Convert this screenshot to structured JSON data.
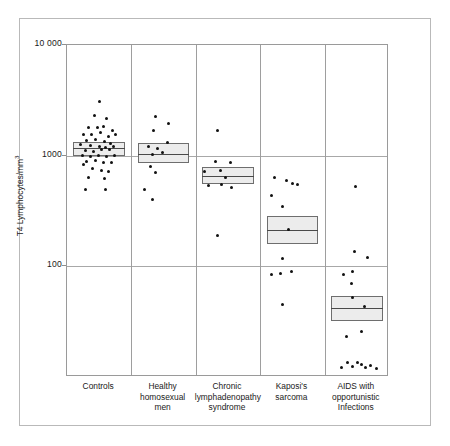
{
  "chart_data": {
    "type": "scatter",
    "title": "",
    "subtitle": "",
    "xlabel": "",
    "ylabel": "T4 Lymphocytes/mm",
    "ylabel_superscript": "3",
    "yscale": "log",
    "ylim": [
      10,
      10000
    ],
    "ytick_labels": [
      "10 000",
      "1000",
      "100"
    ],
    "ytick_values": [
      10000,
      1000,
      100
    ],
    "grid": true,
    "legend": "none",
    "categories": [
      "Controls",
      "Healthy homosexual men",
      "Chronic lymphadenopathy syndrome",
      "Kaposi's sarcoma",
      "AIDS with opportunistic Infections"
    ],
    "category_lines": [
      [
        "Controls"
      ],
      [
        "Healthy",
        "homosexual",
        "men"
      ],
      [
        "Chronic",
        "lymphadenopathy",
        "syndrome"
      ],
      [
        "Kaposi's",
        "sarcoma"
      ],
      [
        "AIDS with",
        "opportunistic",
        "Infections"
      ]
    ],
    "series": [
      {
        "name": "Controls",
        "box": {
          "lower": 1000,
          "median": 1180,
          "upper": 1330
        },
        "points": [
          {
            "xoff": 0.5,
            "value": 3100
          },
          {
            "xoff": 0.42,
            "value": 2300
          },
          {
            "xoff": 0.62,
            "value": 2150
          },
          {
            "xoff": 0.33,
            "value": 1800
          },
          {
            "xoff": 0.47,
            "value": 1800
          },
          {
            "xoff": 0.56,
            "value": 1820
          },
          {
            "xoff": 0.7,
            "value": 1700
          },
          {
            "xoff": 0.26,
            "value": 1560
          },
          {
            "xoff": 0.38,
            "value": 1550
          },
          {
            "xoff": 0.52,
            "value": 1620
          },
          {
            "xoff": 0.64,
            "value": 1500
          },
          {
            "xoff": 0.75,
            "value": 1560
          },
          {
            "xoff": 0.3,
            "value": 1380
          },
          {
            "xoff": 0.44,
            "value": 1400
          },
          {
            "xoff": 0.58,
            "value": 1340
          },
          {
            "xoff": 0.68,
            "value": 1300
          },
          {
            "xoff": 0.21,
            "value": 1250
          },
          {
            "xoff": 0.36,
            "value": 1230
          },
          {
            "xoff": 0.5,
            "value": 1200
          },
          {
            "xoff": 0.6,
            "value": 1190
          },
          {
            "xoff": 0.72,
            "value": 1220
          },
          {
            "xoff": 0.28,
            "value": 1120
          },
          {
            "xoff": 0.41,
            "value": 1100
          },
          {
            "xoff": 0.54,
            "value": 1130
          },
          {
            "xoff": 0.66,
            "value": 1140
          },
          {
            "xoff": 0.24,
            "value": 1000
          },
          {
            "xoff": 0.37,
            "value": 980
          },
          {
            "xoff": 0.49,
            "value": 1010
          },
          {
            "xoff": 0.62,
            "value": 990
          },
          {
            "xoff": 0.73,
            "value": 1010
          },
          {
            "xoff": 0.31,
            "value": 880
          },
          {
            "xoff": 0.45,
            "value": 900
          },
          {
            "xoff": 0.57,
            "value": 870
          },
          {
            "xoff": 0.69,
            "value": 860
          },
          {
            "xoff": 0.26,
            "value": 830
          },
          {
            "xoff": 0.4,
            "value": 760
          },
          {
            "xoff": 0.53,
            "value": 740
          },
          {
            "xoff": 0.65,
            "value": 720
          },
          {
            "xoff": 0.34,
            "value": 640
          },
          {
            "xoff": 0.58,
            "value": 620
          },
          {
            "xoff": 0.28,
            "value": 490
          },
          {
            "xoff": 0.6,
            "value": 490
          }
        ]
      },
      {
        "name": "Healthy homosexual men",
        "box": {
          "lower": 860,
          "median": 1040,
          "upper": 1300
        },
        "points": [
          {
            "xoff": 0.38,
            "value": 2270
          },
          {
            "xoff": 0.58,
            "value": 1950
          },
          {
            "xoff": 0.35,
            "value": 1680
          },
          {
            "xoff": 0.56,
            "value": 1320
          },
          {
            "xoff": 0.26,
            "value": 1210
          },
          {
            "xoff": 0.4,
            "value": 1170
          },
          {
            "xoff": 0.33,
            "value": 1030
          },
          {
            "xoff": 0.49,
            "value": 1060
          },
          {
            "xoff": 0.29,
            "value": 790
          },
          {
            "xoff": 0.37,
            "value": 700
          },
          {
            "xoff": 0.21,
            "value": 490
          },
          {
            "xoff": 0.33,
            "value": 400
          }
        ]
      },
      {
        "name": "Chronic lymphadenopathy syndrome",
        "box": {
          "lower": 560,
          "median": 660,
          "upper": 790
        },
        "points": [
          {
            "xoff": 0.34,
            "value": 1700
          },
          {
            "xoff": 0.3,
            "value": 880
          },
          {
            "xoff": 0.54,
            "value": 870
          },
          {
            "xoff": 0.14,
            "value": 720
          },
          {
            "xoff": 0.38,
            "value": 730
          },
          {
            "xoff": 0.46,
            "value": 640
          },
          {
            "xoff": 0.2,
            "value": 540
          },
          {
            "xoff": 0.4,
            "value": 545
          },
          {
            "xoff": 0.56,
            "value": 520
          },
          {
            "xoff": 0.34,
            "value": 190
          }
        ]
      },
      {
        "name": "Kaposi's sarcoma",
        "box": {
          "lower": 160,
          "median": 215,
          "upper": 285
        },
        "points": [
          {
            "xoff": 0.22,
            "value": 640
          },
          {
            "xoff": 0.41,
            "value": 600
          },
          {
            "xoff": 0.5,
            "value": 560
          },
          {
            "xoff": 0.58,
            "value": 550
          },
          {
            "xoff": 0.18,
            "value": 440
          },
          {
            "xoff": 0.34,
            "value": 350
          },
          {
            "xoff": 0.44,
            "value": 215
          },
          {
            "xoff": 0.34,
            "value": 118
          },
          {
            "xoff": 0.18,
            "value": 84
          },
          {
            "xoff": 0.32,
            "value": 86
          },
          {
            "xoff": 0.48,
            "value": 90
          },
          {
            "xoff": 0.34,
            "value": 45
          }
        ]
      },
      {
        "name": "AIDS with opportunistic Infections",
        "box": {
          "lower": 32,
          "median": 42,
          "upper": 54
        },
        "points": [
          {
            "xoff": 0.48,
            "value": 530
          },
          {
            "xoff": 0.46,
            "value": 135
          },
          {
            "xoff": 0.66,
            "value": 120
          },
          {
            "xoff": 0.3,
            "value": 84
          },
          {
            "xoff": 0.44,
            "value": 90
          },
          {
            "xoff": 0.41,
            "value": 70
          },
          {
            "xoff": 0.44,
            "value": 52
          },
          {
            "xoff": 0.62,
            "value": 43
          },
          {
            "xoff": 0.58,
            "value": 26
          },
          {
            "xoff": 0.34,
            "value": 23
          },
          {
            "xoff": 0.26,
            "value": 12.2
          },
          {
            "xoff": 0.35,
            "value": 13.4
          },
          {
            "xoff": 0.44,
            "value": 12.4
          },
          {
            "xoff": 0.51,
            "value": 13.6
          },
          {
            "xoff": 0.58,
            "value": 13.0
          },
          {
            "xoff": 0.64,
            "value": 12.2
          },
          {
            "xoff": 0.72,
            "value": 12.8
          },
          {
            "xoff": 0.8,
            "value": 12.0
          }
        ]
      }
    ]
  },
  "colors": {
    "dot": "#111111",
    "box_fill": "#ececec",
    "box_stroke": "#6e6e6e",
    "grid": "#a8a8a8",
    "frame": "#b9b9b9",
    "axis": "#9a9a9a",
    "text": "#1a1a1a"
  }
}
